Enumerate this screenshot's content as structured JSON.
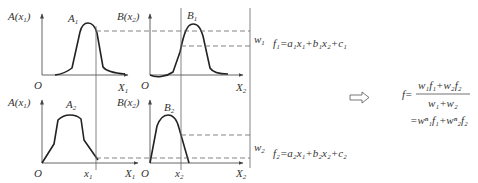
{
  "diagram": {
    "title": "",
    "panels": {
      "top_left": {
        "y_label": "A(x",
        "y_label_sub": "1",
        "y_label_close": ")",
        "curve_label": "A",
        "curve_label_sub": "1",
        "origin": "O",
        "x_label": "X",
        "x_label_sub": "1"
      },
      "top_right": {
        "y_label": "B(x",
        "y_label_sub": "2",
        "y_label_close": ")",
        "curve_label": "B",
        "curve_label_sub": "1",
        "origin": "O",
        "x_label": "X",
        "x_label_sub": "2"
      },
      "bottom_left": {
        "y_label": "A(x",
        "y_label_sub": "1",
        "y_label_close": ")",
        "curve_label": "A",
        "curve_label_sub": "2",
        "origin": "O",
        "x_tick": "x",
        "x_tick_sub": "1",
        "x_label": "X",
        "x_label_sub": "1"
      },
      "bottom_right": {
        "y_label": "B(x",
        "y_label_sub": "2",
        "y_label_close": ")",
        "curve_label": "B",
        "curve_label_sub": "2",
        "origin": "O",
        "x_tick": "x",
        "x_tick_sub": "2",
        "x_label": "X",
        "x_label_sub": "2"
      }
    },
    "weights": {
      "w1": {
        "base": "w",
        "sub": "1"
      },
      "w2": {
        "base": "w",
        "sub": "2"
      }
    },
    "rules": {
      "f1": "f₁=a₁x₁+b₁x₂+c₁",
      "f2": "f₂=a₂x₁+b₂x₂+c₂"
    },
    "arrow": "implies-arrow",
    "result": {
      "lhs": "f=",
      "numerator": "w₁f₁+w₂f₂",
      "denominator": "w₁+w₂",
      "line2": "=wⁿ₁f₁+wⁿ₂f₂"
    }
  }
}
